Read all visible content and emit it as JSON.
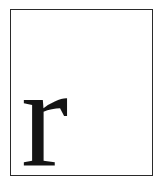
{
  "card": {
    "letter": "r"
  },
  "colors": {
    "border": "#2a2a2a",
    "letter": "#141414",
    "background": "#ffffff"
  }
}
